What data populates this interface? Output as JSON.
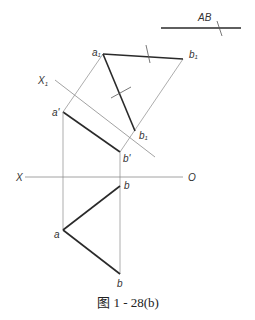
{
  "figure": {
    "caption": "图 1 - 28(b)",
    "true_length_label": "AB",
    "axes": {
      "x_axis_left": "X",
      "x_axis_right": "O",
      "auxiliary_axis": "X",
      "auxiliary_axis_subscript": "1"
    },
    "points": {
      "a_prime": "a'",
      "b_prime": "b'",
      "a": "a",
      "b_upper": "b",
      "b_lower": "b",
      "a1": "a",
      "a1_sub": "1",
      "b1_upper": "b",
      "b1_upper_sub": "1",
      "b1_lower": "b",
      "b1_lower_sub": "1"
    },
    "colors": {
      "thick_line": "#2a2a2a",
      "thin_line": "#8a8a8a",
      "text": "#333333"
    }
  }
}
